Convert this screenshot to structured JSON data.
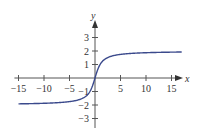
{
  "chart_data": {
    "type": "line",
    "title": "",
    "xlabel": "x",
    "ylabel": "y",
    "xlim": [
      -15.5,
      17
    ],
    "ylim": [
      -3.5,
      4
    ],
    "grid": false,
    "legend": null,
    "x_ticks": [
      -15,
      -10,
      -5,
      5,
      10,
      15
    ],
    "x_tick_labels": [
      "−15",
      "−10",
      "−5",
      "5",
      "10",
      "15"
    ],
    "y_ticks": [
      -3,
      -2,
      -1,
      1,
      2,
      3
    ],
    "y_tick_labels": [
      "−3",
      "−2",
      "−1",
      "1",
      "2",
      "3"
    ],
    "series": [
      {
        "name": "curve",
        "color": "#3b4a8c",
        "x": [
          -15,
          -10,
          -5,
          -3,
          -2,
          -1,
          -0.5,
          0,
          0.5,
          1,
          2,
          3,
          5,
          10,
          15,
          17
        ],
        "y": [
          -1.92,
          -1.87,
          -1.75,
          -1.59,
          -1.41,
          -1.0,
          -0.59,
          0,
          0.59,
          1.0,
          1.41,
          1.59,
          1.75,
          1.87,
          1.92,
          1.93
        ]
      }
    ],
    "asymptotes": [
      2,
      -2
    ]
  }
}
